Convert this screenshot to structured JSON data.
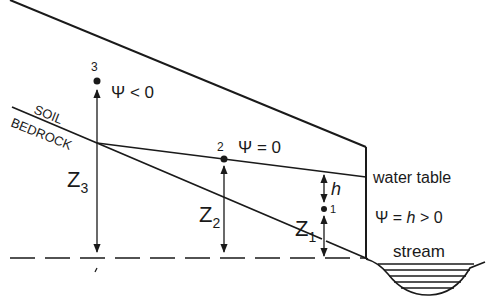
{
  "diagram": {
    "labels": {
      "soil": "SOIL",
      "bedrock": "BEDROCK",
      "water_table": "water table",
      "stream": "stream",
      "point1": "1",
      "point2": "2",
      "point3": "3",
      "psi_lt0": "Ψ < 0",
      "psi_eq0": "Ψ = 0",
      "psi_h": "Ψ = ",
      "psi_h_var": "h",
      "psi_h_tail": " > 0",
      "h": "h",
      "z1": "Z",
      "z1_sub": "1",
      "z2": "Z",
      "z2_sub": "2",
      "z3": "Z",
      "z3_sub": "3"
    },
    "colors": {
      "stroke": "#1a1a1a",
      "background": "#ffffff"
    }
  }
}
